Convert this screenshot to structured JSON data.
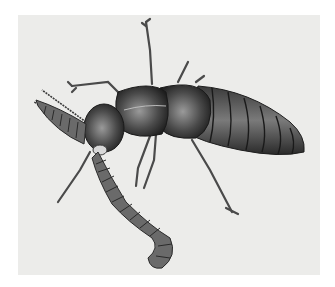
{
  "image": {
    "subject": "beetle-grasping-worm-illustration",
    "style": "grayscale pencil drawing",
    "colors": {
      "background": "#ffffff",
      "paper": "#ececea",
      "body_dark": "#2a2a2a",
      "body_mid": "#5a5a5a",
      "highlight": "#9a9a9a"
    }
  }
}
